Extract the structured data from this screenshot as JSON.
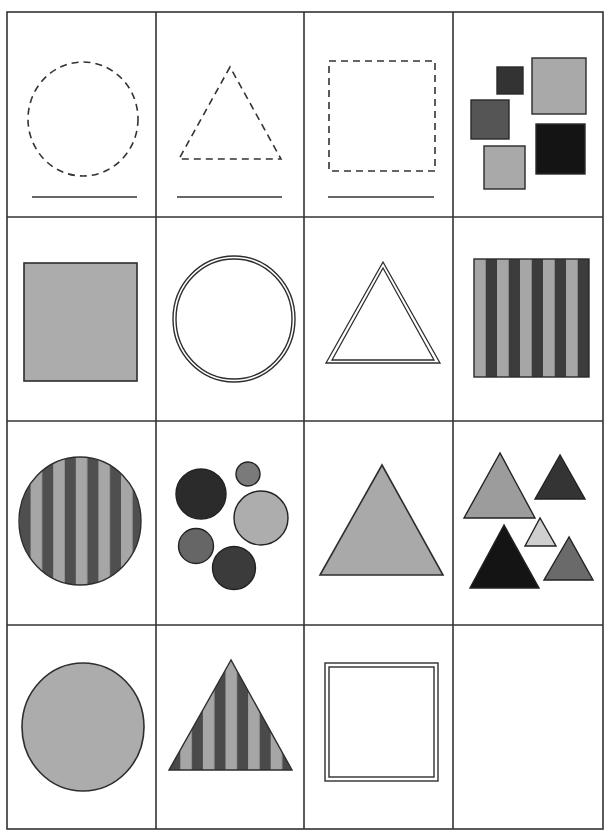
{
  "worksheet": {
    "grid": {
      "columns": 4,
      "rows": 4,
      "x_lines": [
        7,
        156,
        304,
        453,
        603
      ],
      "y_lines": [
        12,
        217,
        421,
        625,
        829
      ],
      "line_color": "#333333"
    },
    "colors": {
      "outline": "#2e2e2e",
      "fill_light": "#a9a9a9",
      "fill_pale": "#cfcfcf",
      "fill_mid": "#6e6e6e",
      "fill_dark": "#3a3a3a",
      "fill_black": "#141414",
      "stripe_light": "#a6a6a6",
      "stripe_dark": "#4a4a4a"
    },
    "cells": [
      {
        "row": 0,
        "col": 0,
        "shape": "circle",
        "style": "dashed-outline",
        "answer_line": true
      },
      {
        "row": 0,
        "col": 1,
        "shape": "triangle",
        "style": "dashed-outline",
        "answer_line": true
      },
      {
        "row": 0,
        "col": 2,
        "shape": "square",
        "style": "dashed-outline",
        "answer_line": true
      },
      {
        "row": 0,
        "col": 3,
        "shape": "squares-group",
        "style": "filled-mixed",
        "count": 5
      },
      {
        "row": 1,
        "col": 0,
        "shape": "square",
        "style": "filled-gray"
      },
      {
        "row": 1,
        "col": 1,
        "shape": "circle",
        "style": "double-outline"
      },
      {
        "row": 1,
        "col": 2,
        "shape": "triangle",
        "style": "double-outline"
      },
      {
        "row": 1,
        "col": 3,
        "shape": "square",
        "style": "striped"
      },
      {
        "row": 2,
        "col": 0,
        "shape": "circle",
        "style": "striped"
      },
      {
        "row": 2,
        "col": 1,
        "shape": "circles-group",
        "style": "filled-mixed",
        "count": 5
      },
      {
        "row": 2,
        "col": 2,
        "shape": "triangle",
        "style": "filled-gray"
      },
      {
        "row": 2,
        "col": 3,
        "shape": "triangles-group",
        "style": "filled-mixed",
        "count": 5
      },
      {
        "row": 3,
        "col": 0,
        "shape": "circle",
        "style": "filled-gray"
      },
      {
        "row": 3,
        "col": 1,
        "shape": "triangle",
        "style": "striped"
      },
      {
        "row": 3,
        "col": 2,
        "shape": "square",
        "style": "double-outline"
      },
      {
        "row": 3,
        "col": 3,
        "shape": "empty",
        "style": "blank"
      }
    ]
  }
}
